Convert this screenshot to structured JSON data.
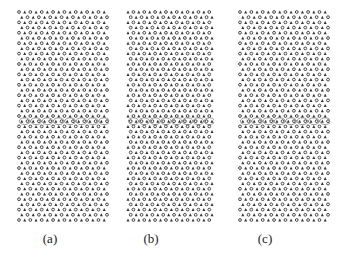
{
  "figure": {
    "panels": [
      {
        "id": "a",
        "caption": "(a)",
        "x": 17,
        "width": 92,
        "caption_x": 50
      },
      {
        "id": "b",
        "caption": "(b)",
        "x": 126,
        "width": 88,
        "caption_x": 151
      },
      {
        "id": "c",
        "caption": "(c)",
        "x": 238,
        "width": 92,
        "caption_x": 265
      }
    ],
    "lattice": {
      "rows": 41,
      "columns": 16,
      "row_spacing": 5.2,
      "glyphs": [
        "circle",
        "triangle"
      ],
      "defect_band_rows": [
        20,
        21,
        22
      ],
      "color": "#333333"
    }
  }
}
